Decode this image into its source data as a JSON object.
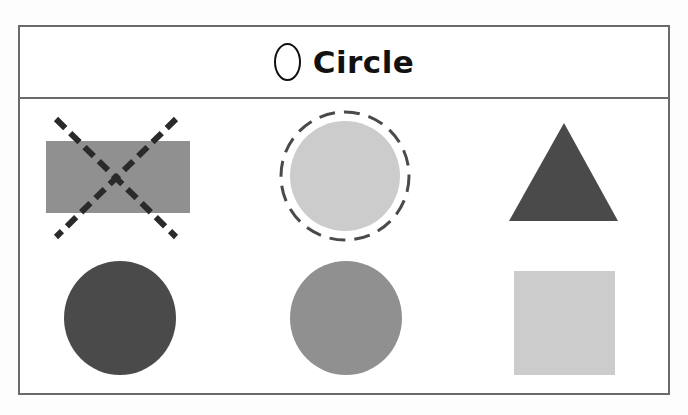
{
  "header": {
    "icon": "circle-outline-icon",
    "title": "Circle"
  },
  "shapes": [
    {
      "row": 1,
      "col": 1,
      "type": "rectangle",
      "color": "#909090",
      "marking": "crossed-out (dashed X)",
      "marking_color": "#2a2a2a"
    },
    {
      "row": 1,
      "col": 2,
      "type": "circle",
      "color": "#cccccc",
      "marking": "dashed ring (selected)",
      "marking_color": "#4a4a4a"
    },
    {
      "row": 1,
      "col": 3,
      "type": "triangle",
      "color": "#4a4a4a",
      "marking": "none"
    },
    {
      "row": 2,
      "col": 1,
      "type": "circle",
      "color": "#4a4a4a",
      "marking": "none"
    },
    {
      "row": 2,
      "col": 2,
      "type": "circle",
      "color": "#909090",
      "marking": "none"
    },
    {
      "row": 2,
      "col": 3,
      "type": "square",
      "color": "#cccccc",
      "marking": "none"
    }
  ],
  "colors": {
    "dark": "#4a4a4a",
    "medium": "#909090",
    "light": "#cccccc",
    "border": "#6a6a6a"
  }
}
